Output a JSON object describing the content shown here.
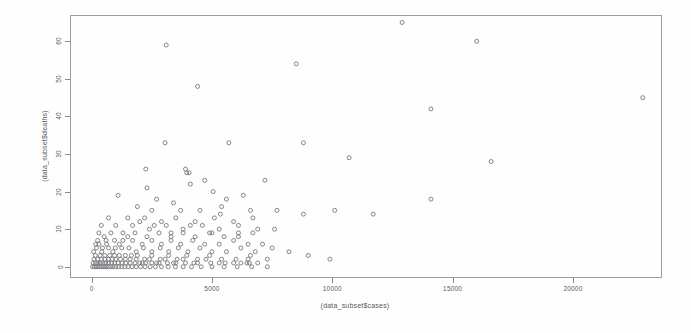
{
  "figure": {
    "background": "#fefefe",
    "plot_border_color": "#9b9c9f",
    "marker_color": "#77787c"
  },
  "chart_data": {
    "type": "scatter",
    "title": "",
    "xlabel": "(data_subset$cases)",
    "ylabel": "(data_subset$deaths)",
    "xlim": [
      -900,
      23700
    ],
    "ylim": [
      -3,
      67
    ],
    "xticks": [
      0,
      5000,
      10000,
      15000,
      20000
    ],
    "yticks": [
      0,
      10,
      20,
      30,
      40,
      50,
      60
    ],
    "xticklabels": [
      "0",
      "5000",
      "10000",
      "15000",
      "20000"
    ],
    "yticklabels": [
      "0",
      "10",
      "20",
      "30",
      "40",
      "50",
      "60"
    ],
    "grid": false,
    "legend": null,
    "marker": "open-circle",
    "marker_size": 4,
    "series": [
      {
        "name": "cases vs deaths",
        "points": [
          [
            3100,
            59
          ],
          [
            8500,
            54
          ],
          [
            12900,
            65
          ],
          [
            16000,
            60
          ],
          [
            4400,
            48
          ],
          [
            22900,
            45
          ],
          [
            14100,
            42
          ],
          [
            16600,
            28
          ],
          [
            3050,
            33
          ],
          [
            5700,
            33
          ],
          [
            8800,
            33
          ],
          [
            10700,
            29
          ],
          [
            3900,
            26
          ],
          [
            3950,
            25
          ],
          [
            4700,
            23
          ],
          [
            7200,
            23
          ],
          [
            1100,
            19
          ],
          [
            2700,
            18
          ],
          [
            3400,
            17
          ],
          [
            5600,
            18
          ],
          [
            6300,
            19
          ],
          [
            14100,
            18
          ],
          [
            1900,
            16
          ],
          [
            2500,
            15
          ],
          [
            3700,
            15
          ],
          [
            4500,
            15
          ],
          [
            5400,
            16
          ],
          [
            6600,
            15
          ],
          [
            7700,
            15
          ],
          [
            8800,
            14
          ],
          [
            10100,
            15
          ],
          [
            11700,
            14
          ],
          [
            700,
            13
          ],
          [
            1500,
            13
          ],
          [
            2200,
            13
          ],
          [
            2900,
            12
          ],
          [
            3500,
            13
          ],
          [
            4300,
            12
          ],
          [
            5100,
            13
          ],
          [
            5900,
            12
          ],
          [
            6700,
            13
          ],
          [
            400,
            11
          ],
          [
            1000,
            11
          ],
          [
            1700,
            11
          ],
          [
            2400,
            10
          ],
          [
            3100,
            11
          ],
          [
            3800,
            10
          ],
          [
            4600,
            11
          ],
          [
            5300,
            10
          ],
          [
            6100,
            11
          ],
          [
            6900,
            10
          ],
          [
            7600,
            10
          ],
          [
            300,
            9
          ],
          [
            800,
            9
          ],
          [
            1300,
            9
          ],
          [
            1800,
            9
          ],
          [
            2300,
            8
          ],
          [
            2800,
            9
          ],
          [
            3300,
            8
          ],
          [
            3800,
            9
          ],
          [
            4300,
            8
          ],
          [
            4900,
            9
          ],
          [
            5500,
            8
          ],
          [
            6100,
            8
          ],
          [
            6700,
            9
          ],
          [
            250,
            7
          ],
          [
            600,
            7
          ],
          [
            950,
            7
          ],
          [
            1300,
            7
          ],
          [
            1700,
            7
          ],
          [
            2100,
            6
          ],
          [
            2500,
            7
          ],
          [
            2900,
            6
          ],
          [
            3300,
            7
          ],
          [
            3700,
            6
          ],
          [
            4200,
            7
          ],
          [
            4700,
            6
          ],
          [
            5300,
            6
          ],
          [
            5900,
            7
          ],
          [
            6500,
            6
          ],
          [
            7100,
            6
          ],
          [
            200,
            5
          ],
          [
            450,
            5
          ],
          [
            700,
            5
          ],
          [
            980,
            5
          ],
          [
            1250,
            5
          ],
          [
            1550,
            5
          ],
          [
            1850,
            4
          ],
          [
            2150,
            5
          ],
          [
            2500,
            4
          ],
          [
            2850,
            5
          ],
          [
            3200,
            4
          ],
          [
            3600,
            5
          ],
          [
            4000,
            4
          ],
          [
            4500,
            5
          ],
          [
            5000,
            4
          ],
          [
            5600,
            4
          ],
          [
            6200,
            5
          ],
          [
            6800,
            4
          ],
          [
            150,
            3
          ],
          [
            350,
            3
          ],
          [
            550,
            3
          ],
          [
            750,
            3
          ],
          [
            950,
            3
          ],
          [
            1150,
            3
          ],
          [
            1400,
            3
          ],
          [
            1650,
            3
          ],
          [
            1900,
            3
          ],
          [
            2200,
            2
          ],
          [
            2500,
            3
          ],
          [
            2850,
            2
          ],
          [
            3200,
            3
          ],
          [
            3550,
            2
          ],
          [
            3950,
            3
          ],
          [
            4400,
            2
          ],
          [
            4900,
            3
          ],
          [
            5400,
            2
          ],
          [
            6000,
            2
          ],
          [
            6600,
            3
          ],
          [
            7300,
            2
          ],
          [
            100,
            2
          ],
          [
            250,
            2
          ],
          [
            400,
            2
          ],
          [
            550,
            2
          ],
          [
            700,
            2
          ],
          [
            850,
            2
          ],
          [
            1000,
            2
          ],
          [
            1200,
            2
          ],
          [
            1400,
            2
          ],
          [
            1600,
            2
          ],
          [
            1850,
            2
          ],
          [
            2100,
            1
          ],
          [
            2400,
            2
          ],
          [
            2700,
            1
          ],
          [
            3050,
            2
          ],
          [
            3400,
            1
          ],
          [
            3800,
            2
          ],
          [
            4250,
            1
          ],
          [
            4750,
            2
          ],
          [
            5300,
            1
          ],
          [
            5900,
            1
          ],
          [
            6500,
            2
          ],
          [
            60,
            1
          ],
          [
            160,
            1
          ],
          [
            260,
            1
          ],
          [
            360,
            1
          ],
          [
            470,
            1
          ],
          [
            580,
            1
          ],
          [
            700,
            1
          ],
          [
            830,
            1
          ],
          [
            960,
            1
          ],
          [
            1100,
            1
          ],
          [
            1260,
            1
          ],
          [
            1420,
            1
          ],
          [
            1600,
            1
          ],
          [
            1800,
            1
          ],
          [
            2000,
            1
          ],
          [
            2250,
            1
          ],
          [
            2500,
            1
          ],
          [
            2800,
            1
          ],
          [
            3150,
            1
          ],
          [
            3500,
            1
          ],
          [
            3900,
            1
          ],
          [
            4400,
            1
          ],
          [
            4950,
            1
          ],
          [
            5550,
            1
          ],
          [
            6200,
            1
          ],
          [
            6900,
            1
          ],
          [
            40,
            0
          ],
          [
            110,
            0
          ],
          [
            180,
            0
          ],
          [
            260,
            0
          ],
          [
            340,
            0
          ],
          [
            420,
            0
          ],
          [
            510,
            0
          ],
          [
            600,
            0
          ],
          [
            690,
            0
          ],
          [
            790,
            0
          ],
          [
            890,
            0
          ],
          [
            1000,
            0
          ],
          [
            1120,
            0
          ],
          [
            1250,
            0
          ],
          [
            1380,
            0
          ],
          [
            1520,
            0
          ],
          [
            1680,
            0
          ],
          [
            1850,
            0
          ],
          [
            2030,
            0
          ],
          [
            2220,
            0
          ],
          [
            2430,
            0
          ],
          [
            2650,
            0
          ],
          [
            2900,
            0
          ],
          [
            3180,
            0
          ],
          [
            3480,
            0
          ],
          [
            3800,
            0
          ],
          [
            4150,
            0
          ],
          [
            4550,
            0
          ],
          [
            5000,
            0
          ],
          [
            5500,
            0
          ],
          [
            6050,
            0
          ],
          [
            6650,
            0
          ],
          [
            7300,
            0
          ],
          [
            80,
            4
          ],
          [
            300,
            6
          ],
          [
            520,
            8
          ],
          [
            170,
            6
          ],
          [
            420,
            4
          ],
          [
            620,
            6
          ],
          [
            880,
            4
          ],
          [
            1150,
            6
          ],
          [
            1500,
            8
          ],
          [
            2000,
            12
          ],
          [
            2600,
            11
          ],
          [
            3300,
            9
          ],
          [
            4100,
            11
          ],
          [
            5000,
            9
          ],
          [
            6100,
            9
          ],
          [
            7500,
            5
          ],
          [
            8200,
            4
          ],
          [
            9000,
            3
          ],
          [
            9900,
            2
          ],
          [
            2250,
            26
          ],
          [
            2300,
            21
          ],
          [
            6450,
            1
          ],
          [
            6550,
            1
          ],
          [
            4050,
            25
          ],
          [
            4100,
            22
          ],
          [
            5050,
            20
          ],
          [
            5350,
            14
          ]
        ]
      }
    ]
  }
}
